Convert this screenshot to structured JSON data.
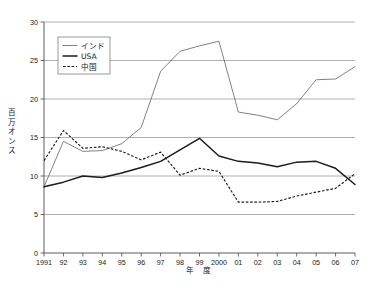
{
  "chart_data": {
    "type": "line",
    "title": "",
    "xlabel": "年　度",
    "ylabel": "百万オンス",
    "ylim": [
      0,
      30
    ],
    "yticks": [
      0,
      5,
      10,
      15,
      20,
      25,
      30
    ],
    "grid": true,
    "legend_position": "upper-left",
    "x": [
      "1991",
      "92",
      "93",
      "94",
      "95",
      "96",
      "97",
      "98",
      "99",
      "2000",
      "01",
      "02",
      "03",
      "04",
      "05",
      "06",
      "07"
    ],
    "categories": [
      "1991",
      "92",
      "93",
      "94",
      "95",
      "96",
      "97",
      "98",
      "99",
      "2000",
      "01",
      "02",
      "03",
      "04",
      "05",
      "06",
      "07"
    ],
    "series": [
      {
        "name": "インド",
        "style": "solid-thin",
        "values": [
          8.6,
          14.5,
          13.2,
          13.3,
          14.2,
          16.3,
          23.6,
          26.2,
          26.9,
          27.5,
          18.3,
          17.9,
          17.3,
          19.4,
          22.5,
          22.6,
          24.2
        ]
      },
      {
        "name": "USA",
        "style": "solid-thick",
        "values": [
          8.6,
          9.2,
          10.0,
          9.8,
          10.4,
          11.1,
          11.9,
          13.4,
          14.9,
          12.6,
          11.9,
          11.7,
          11.2,
          11.8,
          11.9,
          11.0,
          8.9
        ]
      },
      {
        "name": "中国",
        "style": "dashed",
        "values": [
          12.0,
          15.9,
          13.6,
          13.8,
          13.2,
          12.1,
          13.1,
          10.1,
          11.0,
          10.6,
          6.6,
          6.6,
          6.7,
          7.4,
          7.9,
          8.4,
          10.3
        ]
      }
    ]
  },
  "legend": {
    "items": [
      {
        "label": "インド"
      },
      {
        "label": "USA"
      },
      {
        "label": "中国"
      }
    ]
  },
  "axes": {
    "y_title": "百万オンス",
    "x_title": "年　度",
    "y_tick_labels": [
      "0",
      "5",
      "10",
      "15",
      "20",
      "25",
      "30"
    ],
    "x_tick_labels": [
      "1991",
      "92",
      "93",
      "94",
      "95",
      "96",
      "97",
      "98",
      "99",
      "2000",
      "01",
      "02",
      "03",
      "04",
      "05",
      "06",
      "07"
    ]
  },
  "colors": {
    "india": "#6b6b6b",
    "usa": "#1c1c1c",
    "china": "#1c1c1c",
    "grid": "#8c8c8c",
    "axis": "#4a4a4a",
    "background": "#ffffff"
  }
}
